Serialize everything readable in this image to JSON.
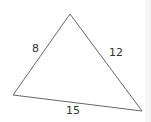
{
  "diagram": {
    "type": "triangle",
    "vertices": {
      "top": [
        70,
        14
      ],
      "left": [
        13,
        95
      ],
      "right": [
        142,
        111
      ]
    },
    "sides": [
      {
        "name": "left",
        "label": "8"
      },
      {
        "name": "right",
        "label": "12"
      },
      {
        "name": "bottom",
        "label": "15"
      }
    ],
    "stroke_color": "#666666"
  }
}
